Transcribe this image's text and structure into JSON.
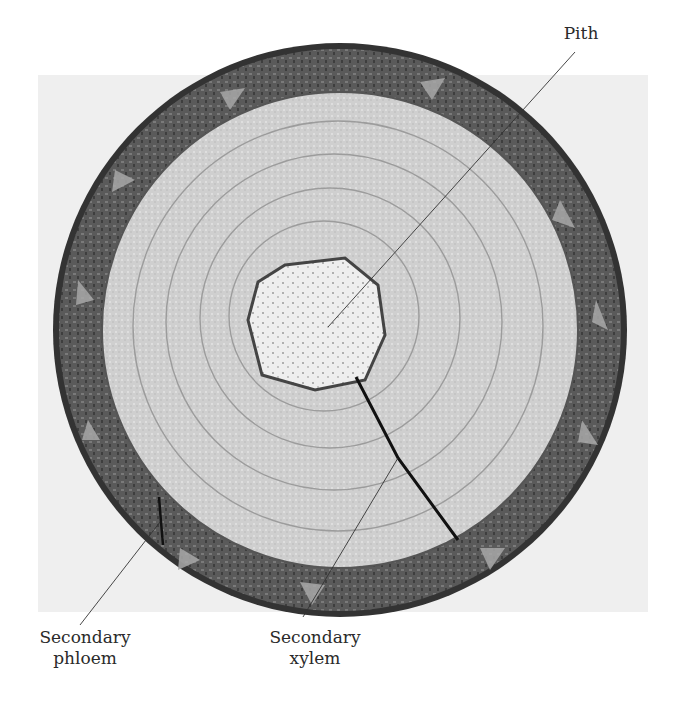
{
  "figure": {
    "labels": {
      "pith": "Pith",
      "secondary_phloem": [
        "Secondary",
        "phloem"
      ],
      "secondary_xylem": [
        "Secondary",
        "xylem"
      ]
    }
  },
  "colors": {
    "background": "#ffffff",
    "photo_background": "#efefef",
    "bark_dark": "#4a4a4a",
    "phloem_band": "#6e6e6e",
    "xylem": "#c9c9c9",
    "pith": "#ececec",
    "label_text": "#2a2a2a"
  }
}
